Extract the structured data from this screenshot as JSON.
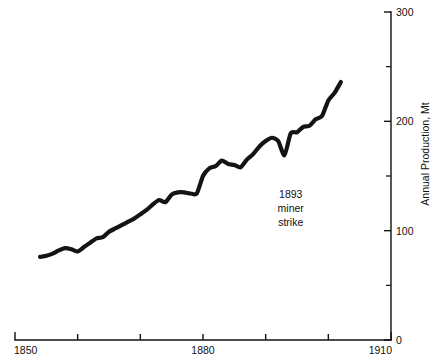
{
  "chart_data": {
    "type": "line",
    "title": "",
    "subtitle": "",
    "xlabel": "",
    "ylabel": "Annual Production, Mt",
    "xlim": [
      1850,
      1910
    ],
    "ylim": [
      0,
      300
    ],
    "grid": false,
    "legend": null,
    "x_ticks_major": [
      1850,
      1860,
      1870,
      1880,
      1890,
      1900,
      1910
    ],
    "x_tick_labels": [
      {
        "value": 1850,
        "label": "1850"
      },
      {
        "value": 1860,
        "label": ""
      },
      {
        "value": 1870,
        "label": ""
      },
      {
        "value": 1880,
        "label": "1880"
      },
      {
        "value": 1890,
        "label": ""
      },
      {
        "value": 1900,
        "label": ""
      },
      {
        "value": 1910,
        "label": "1910"
      }
    ],
    "y_ticks_major": [
      0,
      100,
      200,
      300
    ],
    "y_ticks_minor": [
      50,
      150,
      250
    ],
    "y_tick_labels": [
      {
        "value": 0,
        "label": "0"
      },
      {
        "value": 100,
        "label": "100"
      },
      {
        "value": 200,
        "label": "200"
      },
      {
        "value": 300,
        "label": "300"
      }
    ],
    "axis_position": {
      "y_axis": "right",
      "x_axis": "bottom"
    },
    "line_color": "#141414",
    "series": [
      {
        "name": "Annual Production",
        "x": [
          1854,
          1855,
          1856,
          1857,
          1858,
          1859,
          1860,
          1861,
          1862,
          1863,
          1864,
          1865,
          1866,
          1867,
          1868,
          1869,
          1870,
          1871,
          1872,
          1873,
          1874,
          1875,
          1876,
          1877,
          1878,
          1879,
          1880,
          1881,
          1882,
          1883,
          1884,
          1885,
          1886,
          1887,
          1888,
          1889,
          1890,
          1891,
          1892,
          1893,
          1894,
          1895,
          1896,
          1897,
          1898,
          1899,
          1900,
          1901,
          1902
        ],
        "values": [
          76,
          77,
          79,
          82,
          84,
          83,
          81,
          85,
          89,
          93,
          94,
          99,
          102,
          105,
          108,
          111,
          115,
          119,
          124,
          128,
          126,
          133,
          135,
          135,
          134,
          134,
          150,
          157,
          159,
          164,
          161,
          160,
          158,
          165,
          170,
          177,
          182,
          185,
          182,
          169,
          189,
          190,
          195,
          196,
          202,
          205,
          219,
          226,
          236
        ]
      }
    ],
    "annotations": [
      {
        "name": "1893-miner-strike",
        "lines": [
          "1893",
          "miner",
          "strike"
        ],
        "x": 1894,
        "y": 130
      }
    ]
  },
  "plot_geometry": {
    "left": 15,
    "right": 391,
    "top": 12,
    "bottom": 340
  }
}
